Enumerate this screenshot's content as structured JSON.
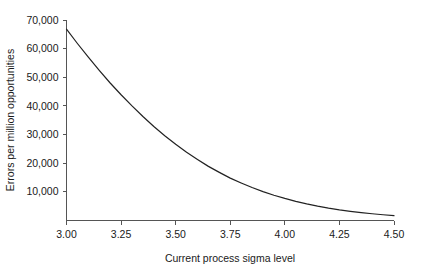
{
  "chart_data": {
    "type": "line",
    "title": "",
    "xlabel": "Current process sigma level",
    "ylabel": "Errors per million opportunities",
    "xlim": [
      3.0,
      4.5
    ],
    "ylim": [
      0,
      70000
    ],
    "grid": false,
    "legend": null,
    "x_tick_labels": [
      "3.00",
      "3.25",
      "3.50",
      "3.75",
      "4.00",
      "4.25",
      "4.50"
    ],
    "x_ticks": [
      3.0,
      3.25,
      3.5,
      3.75,
      4.0,
      4.25,
      4.5
    ],
    "y_tick_labels": [
      "10,000",
      "20,000",
      "30,000",
      "40,000",
      "50,000",
      "60,000",
      "70,000"
    ],
    "y_ticks": [
      10000,
      20000,
      30000,
      40000,
      50000,
      60000,
      70000
    ],
    "series": [
      {
        "name": "Errors per million opportunities",
        "color": "#222222",
        "x": [
          3.0,
          3.05,
          3.1,
          3.15,
          3.2,
          3.25,
          3.3,
          3.35,
          3.4,
          3.45,
          3.5,
          3.55,
          3.6,
          3.65,
          3.7,
          3.75,
          3.8,
          3.85,
          3.9,
          3.95,
          4.0,
          4.05,
          4.1,
          4.15,
          4.2,
          4.25,
          4.3,
          4.35,
          4.4,
          4.45,
          4.5
        ],
        "values": [
          66800,
          61800,
          57000,
          52400,
          48000,
          43900,
          40000,
          36300,
          32800,
          29600,
          26600,
          23800,
          21300,
          18900,
          16800,
          14800,
          13100,
          11500,
          10100,
          8800,
          7700,
          6700,
          5800,
          5000,
          4300,
          3700,
          3200,
          2750,
          2350,
          2000,
          1700
        ]
      }
    ]
  },
  "axes": {
    "x_axis_name": "Current process sigma level",
    "y_axis_name": "Errors per million opportunities"
  }
}
